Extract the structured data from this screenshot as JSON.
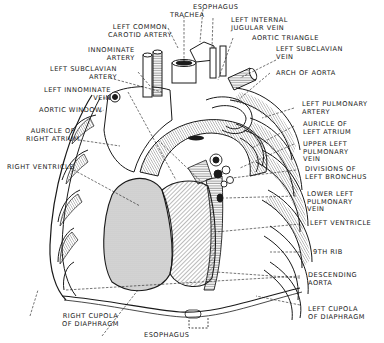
{
  "diagram": {
    "colors": {
      "ink": "#1a1a1a",
      "background": "#ffffff",
      "shade": "#d6d6d6"
    },
    "labels": {
      "trachea": "TRACHEA",
      "esophagus_top": "ESOPHAGUS",
      "left_common_carotid_artery": "LEFT COMMON\nCAROTID ARTERY",
      "left_internal_jugular_vein": "LEFT INTERNAL\nJUGULAR VEIN",
      "aortic_triangle": "AORTIC TRIANGLE",
      "innominate_artery": "INNOMINATE\nARTERY",
      "left_subclavian_vein": "LEFT SUBCLAVIAN\nVEIN",
      "left_subclavian_artery": "LEFT SUBCLAVIAN\nARTERY",
      "arch_of_aorta": "ARCH OF AORTA",
      "left_innominate_vein": "LEFT INNOMINATE\nVEIN",
      "aortic_window": "AORTIC WINDOW",
      "left_pulmonary_artery": "LEFT PULMONARY\nARTERY",
      "auricle_of_left_atrium": "AURICLE OF\nLEFT ATRIUM",
      "auricle_of_right_atrium": "AURICLE OF\nRIGHT ATRIUM",
      "upper_left_pulmonary_vein": "UPPER LEFT\nPULMONARY\nVEIN",
      "right_ventricle": "RIGHT VENTRICLE",
      "divisions_of_left_bronchus": "DIVISIONS OF\nLEFT BRONCHUS",
      "lower_left_pulmonary_vein": "LOWER LEFT\nPULMONARY\nVEIN",
      "left_ventricle": "LEFT VENTRICLE",
      "ninth_rib": "9TH RIB",
      "descending_aorta": "DESCENDING\nAORTA",
      "left_cupola_of_diaphragm": "LEFT CUPOLA\nOF DIAPHRAGM",
      "right_cupola_of_diaphragm": "RIGHT CUPOLA\nOF DIAPHRAGM",
      "esophagus_bottom": "ESOPHAGUS"
    }
  }
}
